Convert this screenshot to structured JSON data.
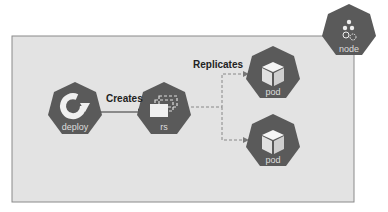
{
  "diagram": {
    "nodes": {
      "deploy": {
        "label": "deploy"
      },
      "rs": {
        "label": "rs"
      },
      "pod1": {
        "label": "pod"
      },
      "pod2": {
        "label": "pod"
      },
      "node": {
        "label": "node"
      }
    },
    "edges": {
      "creates": {
        "label": "Creates"
      },
      "replicates": {
        "label": "Replicates"
      }
    },
    "colors": {
      "hexagon": "#5a5a5a",
      "box": "#e3e3e3",
      "border": "#8a8a8a"
    }
  }
}
